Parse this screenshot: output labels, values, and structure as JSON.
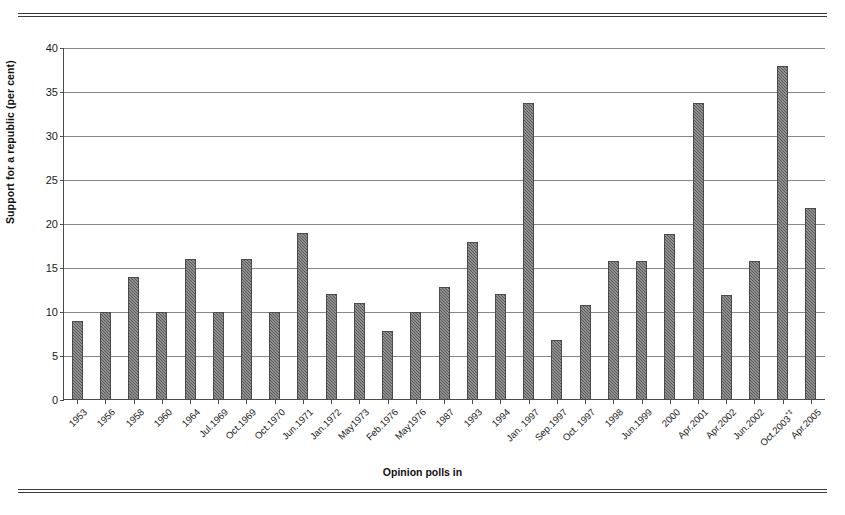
{
  "figure": {
    "background": "#ffffff",
    "rule_color": "#3a3a3a"
  },
  "chart_data": {
    "type": "bar",
    "title": "",
    "xlabel": "Opinion polls in",
    "ylabel": "Support for a republic (per cent)",
    "ylim": [
      0,
      40
    ],
    "yticks": [
      0,
      5,
      10,
      15,
      20,
      25,
      30,
      35,
      40
    ],
    "grid": true,
    "legend": false,
    "bar_color": "#5a5a5a",
    "categories": [
      "1953",
      "1956",
      "1958",
      "1960",
      "1964",
      "Jul.1969",
      "Oct.1969",
      "Oct.1970",
      "Jun.1971",
      "Jan.1972",
      "May1973",
      "Feb.1976",
      "May1976",
      "1987",
      "1993",
      "1994",
      "Jan. 1997",
      "Sep.1997",
      "Oct. 1997",
      "1998",
      "Jun.1999",
      "2000",
      "Apr.2001",
      "Apr.2002",
      "Jun.2002",
      "Oct.2003*‡",
      "Apr.2005"
    ],
    "values": [
      9.0,
      10.0,
      14.0,
      10.0,
      16.0,
      10.0,
      16.0,
      10.0,
      19.0,
      12.0,
      11.0,
      7.8,
      10.0,
      12.8,
      18.0,
      12.0,
      33.8,
      6.8,
      10.8,
      15.8,
      15.8,
      18.9,
      33.8,
      11.9,
      15.8,
      37.9,
      21.8
    ]
  }
}
